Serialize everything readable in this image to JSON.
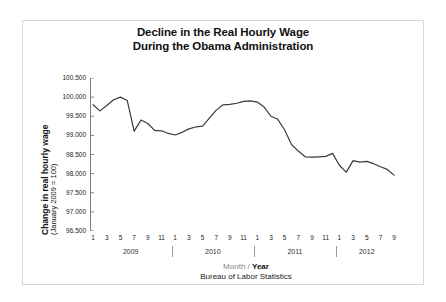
{
  "figure": {
    "background_color": "#ffffff",
    "frame_color": "#d8d8d8",
    "line_color": "#3a3a3a",
    "axis_color": "#808080"
  },
  "title": {
    "line1": "Decline in the Real Hourly Wage",
    "line2": "During the Obama Administration"
  },
  "axis_titles": {
    "y_main": "Change in real hourly wage",
    "y_sub": "(January 2009 = 100)",
    "x_month": "Month",
    "x_slash": " / ",
    "x_year": "Year"
  },
  "source": "Bureau of Labor Statistics",
  "chart_data": {
    "type": "line",
    "title": "Decline in the Real Hourly Wage During the Obama Administration",
    "subtitle": "",
    "xlabel": "Month / Year",
    "ylabel": "Change in real hourly wage (January 2009 = 100)",
    "ylim": [
      96.5,
      100.5
    ],
    "yticks": [
      100.5,
      100.0,
      99.5,
      99.0,
      98.5,
      98.0,
      97.5,
      97.0,
      96.5
    ],
    "ytick_labels": [
      "100.500",
      "100.000",
      "99.500",
      "99.000",
      "98.500",
      "98.000",
      "97.500",
      "97.000",
      "96.500"
    ],
    "grid": false,
    "legend": "none",
    "x_tick_labels": [
      "1",
      "3",
      "5",
      "7",
      "9",
      "11",
      "1",
      "3",
      "5",
      "7",
      "9",
      "11",
      "1",
      "3",
      "5",
      "7",
      "9",
      "11",
      "1",
      "3",
      "5",
      "7",
      "9"
    ],
    "x_tick_months": [
      1,
      3,
      5,
      7,
      9,
      11,
      13,
      15,
      17,
      19,
      21,
      23,
      25,
      27,
      29,
      31,
      33,
      35,
      37,
      39,
      41,
      43,
      45
    ],
    "year_groups": [
      {
        "label": "2009",
        "start_month": 1,
        "end_month": 12
      },
      {
        "label": "2010",
        "start_month": 13,
        "end_month": 24
      },
      {
        "label": "2011",
        "start_month": 25,
        "end_month": 36
      },
      {
        "label": "2012",
        "start_month": 37,
        "end_month": 45
      }
    ],
    "x": [
      1,
      2,
      3,
      4,
      5,
      6,
      7,
      8,
      9,
      10,
      11,
      12,
      13,
      14,
      15,
      16,
      17,
      18,
      19,
      20,
      21,
      22,
      23,
      24,
      25,
      26,
      27,
      28,
      29,
      30,
      31,
      32,
      33,
      34,
      35,
      36,
      37,
      38,
      39,
      40,
      41,
      42,
      43,
      44,
      45
    ],
    "x_point_labels": [
      "1/2009",
      "2/2009",
      "3/2009",
      "4/2009",
      "5/2009",
      "6/2009",
      "7/2009",
      "8/2009",
      "9/2009",
      "10/2009",
      "11/2009",
      "12/2009",
      "1/2010",
      "2/2010",
      "3/2010",
      "4/2010",
      "5/2010",
      "6/2010",
      "7/2010",
      "8/2010",
      "9/2010",
      "10/2010",
      "11/2010",
      "12/2010",
      "1/2011",
      "2/2011",
      "3/2011",
      "4/2011",
      "5/2011",
      "6/2011",
      "7/2011",
      "8/2011",
      "9/2011",
      "10/2011",
      "11/2011",
      "12/2011",
      "1/2012",
      "2/2012",
      "3/2012",
      "4/2012",
      "5/2012",
      "6/2012",
      "7/2012",
      "8/2012",
      "9/2012"
    ],
    "series": [
      {
        "name": "Real hourly wage index",
        "values": [
          99.8,
          99.64,
          99.78,
          99.93,
          100.0,
          99.91,
          99.11,
          99.4,
          99.31,
          99.13,
          99.12,
          99.05,
          99.01,
          99.08,
          99.17,
          99.22,
          99.24,
          99.45,
          99.66,
          99.8,
          99.81,
          99.84,
          99.89,
          99.9,
          99.87,
          99.74,
          99.5,
          99.42,
          99.14,
          98.76,
          98.59,
          98.44,
          98.43,
          98.44,
          98.45,
          98.53,
          98.22,
          98.04,
          98.34,
          98.3,
          98.32,
          98.26,
          98.18,
          98.11,
          97.96
        ]
      }
    ],
    "extra_values_note": ""
  }
}
